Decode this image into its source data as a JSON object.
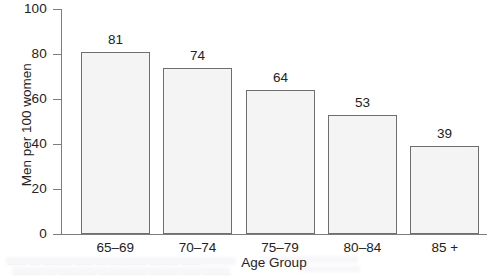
{
  "chart_data": {
    "type": "bar",
    "title": "",
    "xlabel": "Age Group",
    "ylabel": "Men per 100 women",
    "categories": [
      "65–69",
      "70–74",
      "75–79",
      "80–84",
      "85 +"
    ],
    "values": [
      81,
      74,
      64,
      53,
      39
    ],
    "value_labels": [
      "81",
      "74",
      "64",
      "53",
      "39"
    ],
    "ylim": [
      0,
      100
    ],
    "yticks": [
      0,
      20,
      40,
      60,
      80,
      100
    ],
    "ytick_labels": [
      "0",
      "20",
      "40",
      "60",
      "80",
      "100"
    ],
    "grid": false,
    "legend": null,
    "bar_fill_color": "#f4f4f4",
    "bar_edge_color": "#6e6e6e",
    "axis_color": "#7d7d7d",
    "text_color": "#222222",
    "background_color": "#ffffff"
  },
  "artifacts": {
    "line1": "—— — ——— —— — ———— ——— ——",
    "line2": "——— — ———— ————— ——— —— ———"
  }
}
